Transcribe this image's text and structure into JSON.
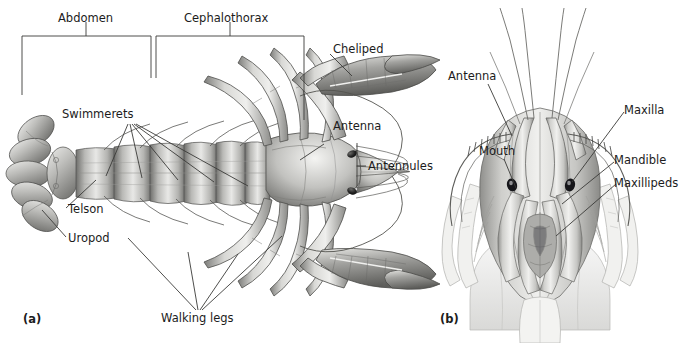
{
  "figure": {
    "background_color": "#ffffff",
    "line_color": "#2b2b2b",
    "text_color": "#1c1c1c"
  },
  "panel_a": {
    "id": "(a)",
    "caption_view": "dorsal view of whole crayfish",
    "brackets": [
      {
        "name": "abdomen",
        "label": "Abdomen"
      },
      {
        "name": "cephalothorax",
        "label": "Cephalothorax"
      },
      {
        "name": "antennules",
        "label": "Antennules"
      }
    ],
    "labels": [
      {
        "name": "abdomen",
        "text": "Abdomen"
      },
      {
        "name": "cephalothorax",
        "text": "Cephalothorax"
      },
      {
        "name": "cheliped",
        "text": "Cheliped"
      },
      {
        "name": "antenna",
        "text": "Antenna"
      },
      {
        "name": "antennules",
        "text": "Antennules"
      },
      {
        "name": "swimmerets",
        "text": "Swimmerets"
      },
      {
        "name": "telson",
        "text": "Telson"
      },
      {
        "name": "uropod",
        "text": "Uropod"
      },
      {
        "name": "walking-legs",
        "text": "Walking legs"
      }
    ]
  },
  "panel_b": {
    "id": "(b)",
    "caption_view": "ventral view of head and mouthparts",
    "labels": [
      {
        "name": "antenna",
        "text": "Antenna"
      },
      {
        "name": "mouth",
        "text": "Mouth"
      },
      {
        "name": "maxilla",
        "text": "Maxilla"
      },
      {
        "name": "mandible",
        "text": "Mandible"
      },
      {
        "name": "maxillipeds",
        "text": "Maxillipeds"
      }
    ]
  }
}
